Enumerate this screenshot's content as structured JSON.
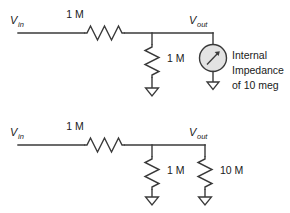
{
  "diagram": {
    "background_color": "#ffffff",
    "line_color": "#3a3a3a",
    "meter_fill_color": "#e3e3e3",
    "circuits": [
      {
        "id": "top",
        "name": "divider-with-meter",
        "input_label": {
          "symbol": "V",
          "subscript": "in"
        },
        "output_label": {
          "symbol": "V",
          "subscript": "out"
        },
        "series_resistor": {
          "name": "series-resistor",
          "value": "1 M"
        },
        "shunt_resistor": {
          "name": "shunt-resistor",
          "value": "1 M"
        },
        "meter": {
          "name": "meter",
          "icon": "meter-icon",
          "note_lines": [
            "Internal",
            "Impedance",
            "of 10 meg"
          ]
        }
      },
      {
        "id": "bottom",
        "name": "divider-with-equivalent-resistor",
        "input_label": {
          "symbol": "V",
          "subscript": "in"
        },
        "output_label": {
          "symbol": "V",
          "subscript": "out"
        },
        "series_resistor": {
          "name": "series-resistor",
          "value": "1 M"
        },
        "shunt_resistor": {
          "name": "shunt-resistor",
          "value": "1 M"
        },
        "load_resistor": {
          "name": "load-resistor",
          "value": "10 M"
        }
      }
    ]
  }
}
